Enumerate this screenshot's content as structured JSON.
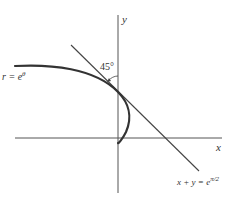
{
  "diagram": {
    "type": "polar-curve-with-tangent",
    "axes": {
      "x_label": "x",
      "y_label": "y"
    },
    "curve": {
      "label_main": "r = e",
      "label_exp": "θ"
    },
    "tangent": {
      "label_main": "x + y = e",
      "label_exp": "π/2"
    },
    "angle": {
      "label": "45°"
    },
    "colors": {
      "curve": "#333333",
      "axes": "#555555",
      "tangent": "#444444",
      "background": "#ffffff"
    }
  }
}
